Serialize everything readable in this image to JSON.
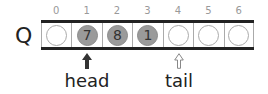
{
  "diagram": {
    "queue_label": "Q",
    "indices": [
      "0",
      "1",
      "2",
      "3",
      "4",
      "5",
      "6"
    ],
    "cells": [
      {
        "value": "",
        "filled": false
      },
      {
        "value": "7",
        "filled": true
      },
      {
        "value": "8",
        "filled": true
      },
      {
        "value": "1",
        "filled": true
      },
      {
        "value": "",
        "filled": false
      },
      {
        "value": "",
        "filled": false
      },
      {
        "value": "",
        "filled": false
      }
    ],
    "pointers": {
      "head": {
        "label": "head",
        "index": 1,
        "style": "solid-arrow"
      },
      "tail": {
        "label": "tail",
        "index": 4,
        "style": "hollow-arrow"
      }
    },
    "colors": {
      "filled": "#9a9a9a",
      "border": "#222222",
      "index_text": "#999999"
    }
  }
}
